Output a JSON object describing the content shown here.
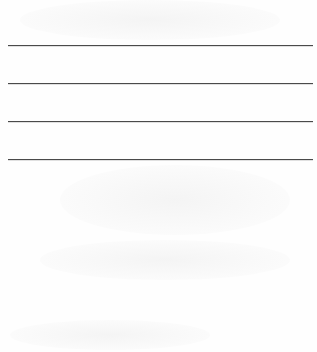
{
  "page": {
    "background": "#ffffff",
    "rule_color": "#4a4a4a",
    "rules": [
      {
        "y": 45
      },
      {
        "y": 83
      },
      {
        "y": 121
      },
      {
        "y": 159
      }
    ]
  }
}
